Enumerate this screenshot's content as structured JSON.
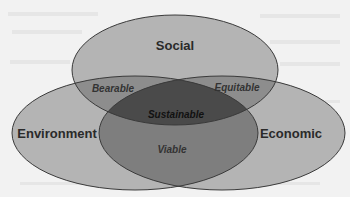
{
  "diagram": {
    "type": "venn",
    "sets": [
      {
        "id": "social",
        "label": "Social"
      },
      {
        "id": "environment",
        "label": "Environment"
      },
      {
        "id": "economic",
        "label": "Economic"
      }
    ],
    "intersections": {
      "social_environment": "Bearable",
      "social_economic": "Equitable",
      "environment_economic": "Viable",
      "all": "Sustainable"
    },
    "colors": {
      "single": "#b4b4b4",
      "double": "#8a8a8a",
      "triple": "#4a4a4a",
      "outline": "#3a3a3a",
      "background": "#f2f2f2"
    }
  }
}
